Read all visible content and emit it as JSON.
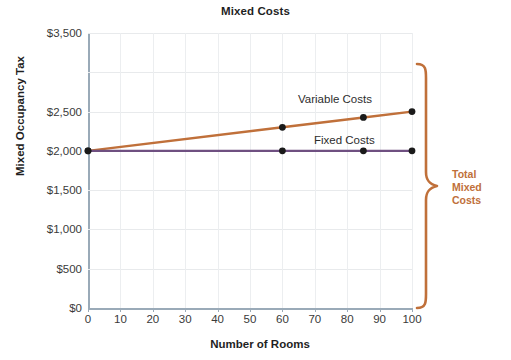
{
  "chart_data": {
    "type": "line",
    "title": "Mixed Costs",
    "xlabel": "Number of Rooms",
    "ylabel": "Mixed Occupancy Tax",
    "xlim": [
      0,
      100
    ],
    "ylim": [
      0,
      3500
    ],
    "grid": true,
    "legend_position": "inline-annotations",
    "x_ticks": [
      0,
      10,
      20,
      30,
      40,
      50,
      60,
      70,
      80,
      90,
      100
    ],
    "x_tick_labels": [
      "0",
      "10",
      "20",
      "30",
      "40",
      "50",
      "60",
      "70",
      "80",
      "90",
      "100"
    ],
    "y_ticks": [
      0,
      500,
      1000,
      1500,
      2000,
      2500,
      3500
    ],
    "y_tick_labels": [
      "$0",
      "$500",
      "$1,000",
      "$1,500",
      "$2,000",
      "$2,500",
      "$3,500"
    ],
    "series": [
      {
        "name": "Variable Costs",
        "color": "#c0703a",
        "marker_color": "#1a1a1a",
        "x": [
          0,
          60,
          85,
          100
        ],
        "values": [
          2000,
          2300,
          2425,
          2500
        ]
      },
      {
        "name": "Fixed Costs",
        "color": "#6f5081",
        "marker_color": "#1a1a1a",
        "x": [
          0,
          60,
          85,
          100
        ],
        "values": [
          2000,
          2000,
          2000,
          2000
        ]
      }
    ],
    "annotations": [
      {
        "name": "Total Mixed Costs",
        "text": "Total Mixed Costs",
        "lines": [
          "Total",
          "Mixed",
          "Costs"
        ],
        "type": "brace",
        "color": "#c0703a",
        "spans_from": 0,
        "spans_to": 2500,
        "at_x": 100
      }
    ]
  },
  "colors": {
    "variable_costs": "#c0703a",
    "fixed_costs": "#6f5081",
    "annotation": "#c0703a",
    "axis": "#9aaab8",
    "grid": "#e8eaec",
    "text": "#1f1f1f"
  }
}
